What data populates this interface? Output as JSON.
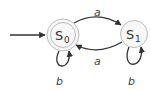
{
  "diagram": {
    "type": "finite-state-automaton",
    "states": [
      {
        "id": "s0",
        "name": "S",
        "subscript": "0",
        "accepting": true,
        "initial": true
      },
      {
        "id": "s1",
        "name": "S",
        "subscript": "1",
        "accepting": false,
        "initial": false
      }
    ],
    "transitions": [
      {
        "from": "s0",
        "to": "s1",
        "label": "a"
      },
      {
        "from": "s1",
        "to": "s0",
        "label": "a"
      },
      {
        "from": "s0",
        "to": "s0",
        "label": "b"
      },
      {
        "from": "s1",
        "to": "s1",
        "label": "b"
      }
    ],
    "colors": {
      "edge": "#333333",
      "state_stroke": "#bbbbbb",
      "state_fill": "#f7f7f7",
      "text": "#333333"
    }
  }
}
